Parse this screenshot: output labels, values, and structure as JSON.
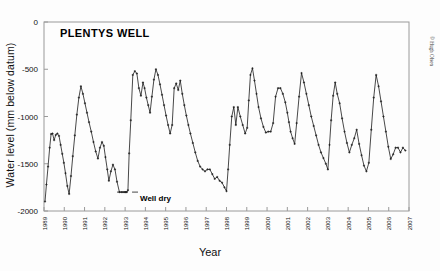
{
  "figure": {
    "title": "PLENTYS WELL",
    "xlabel": "Year",
    "ylabel": "Water level (mm below datum)",
    "credit": "© Hugh Olsen",
    "annotation": "Well dry",
    "line_color": "#1a1a1a",
    "frame_color": "#9a9a9a",
    "background": "#fdfdfd"
  },
  "chart_data": {
    "type": "line",
    "title": "PLENTYS WELL",
    "xlabel": "Year",
    "ylabel": "Water level (mm below datum)",
    "xlim": [
      1989,
      2007
    ],
    "ylim": [
      -2000,
      0
    ],
    "xticks": [
      1989,
      1990,
      1991,
      1992,
      1993,
      1994,
      1995,
      1996,
      1997,
      1998,
      1999,
      2000,
      2001,
      2002,
      2003,
      2004,
      2005,
      2006,
      2007
    ],
    "xtick_labels": [
      "1989",
      "1990",
      "1991",
      "1992",
      "1993",
      "1994",
      "1995",
      "1996",
      "1997",
      "1998",
      "1999",
      "2000",
      "2001",
      "2002",
      "2003",
      "2004",
      "2005",
      "2006",
      "2007"
    ],
    "yticks": [
      0,
      -500,
      -1000,
      -1500,
      -2000
    ],
    "ytick_labels": [
      "0",
      "-500",
      "-1000",
      "-1500",
      "-2000"
    ],
    "grid": false,
    "legend": null,
    "markers": "plus",
    "annotations": [
      {
        "text": "Well dry",
        "x": 1992.75,
        "y": -1800
      }
    ],
    "series": [
      {
        "name": "Water level",
        "color": "#1a1a1a",
        "x": [
          1989.05,
          1989.12,
          1989.2,
          1989.28,
          1989.35,
          1989.42,
          1989.5,
          1989.58,
          1989.66,
          1989.74,
          1989.82,
          1989.9,
          1989.98,
          1990.06,
          1990.15,
          1990.24,
          1990.33,
          1990.42,
          1990.52,
          1990.62,
          1990.72,
          1990.82,
          1990.92,
          1991.02,
          1991.12,
          1991.22,
          1991.33,
          1991.44,
          1991.55,
          1991.66,
          1991.76,
          1991.86,
          1991.95,
          1992.03,
          1992.12,
          1992.2,
          1992.3,
          1992.4,
          1992.5,
          1992.6,
          1992.72,
          1992.84,
          1992.95,
          1993.02,
          1993.08,
          1993.14,
          1993.2,
          1993.28,
          1993.38,
          1993.48,
          1993.58,
          1993.68,
          1993.78,
          1993.88,
          1993.96,
          1994.05,
          1994.14,
          1994.23,
          1994.32,
          1994.42,
          1994.52,
          1994.62,
          1994.72,
          1994.82,
          1994.92,
          1995.02,
          1995.12,
          1995.22,
          1995.32,
          1995.42,
          1995.52,
          1995.62,
          1995.72,
          1995.82,
          1995.92,
          1996.02,
          1996.12,
          1996.22,
          1996.34,
          1996.46,
          1996.58,
          1996.7,
          1996.82,
          1996.94,
          1997.06,
          1997.18,
          1997.3,
          1997.42,
          1997.54,
          1997.66,
          1997.78,
          1997.9,
          1998.0,
          1998.08,
          1998.16,
          1998.26,
          1998.36,
          1998.46,
          1998.56,
          1998.68,
          1998.8,
          1998.92,
          1999.02,
          1999.1,
          1999.18,
          1999.28,
          1999.38,
          1999.48,
          1999.58,
          1999.7,
          1999.82,
          1999.94,
          2000.06,
          2000.18,
          2000.3,
          2000.42,
          2000.54,
          2000.66,
          2000.78,
          2000.9,
          2001.0,
          2001.08,
          2001.16,
          2001.26,
          2001.36,
          2001.46,
          2001.58,
          2001.7,
          2001.82,
          2001.94,
          2002.06,
          2002.18,
          2002.3,
          2002.42,
          2002.54,
          2002.66,
          2002.78,
          2002.9,
          2003.0,
          2003.08,
          2003.16,
          2003.26,
          2003.36,
          2003.46,
          2003.58,
          2003.7,
          2003.82,
          2003.94,
          2004.06,
          2004.18,
          2004.3,
          2004.42,
          2004.54,
          2004.66,
          2004.78,
          2004.9,
          2005.02,
          2005.14,
          2005.26,
          2005.38,
          2005.5,
          2005.62,
          2005.74,
          2005.86,
          2005.98,
          2006.1,
          2006.22,
          2006.34,
          2006.46,
          2006.58,
          2006.7,
          2006.82
        ],
        "y": [
          -1900,
          -1720,
          -1530,
          -1330,
          -1185,
          -1180,
          -1250,
          -1195,
          -1180,
          -1205,
          -1300,
          -1395,
          -1490,
          -1600,
          -1735,
          -1820,
          -1630,
          -1420,
          -1200,
          -980,
          -800,
          -680,
          -760,
          -860,
          -960,
          -1060,
          -1160,
          -1270,
          -1370,
          -1445,
          -1330,
          -1270,
          -1310,
          -1430,
          -1560,
          -1680,
          -1580,
          -1510,
          -1560,
          -1690,
          -1800,
          -1800,
          -1800,
          -1800,
          -1800,
          -1780,
          -1390,
          -1040,
          -560,
          -520,
          -545,
          -700,
          -780,
          -640,
          -700,
          -800,
          -880,
          -960,
          -790,
          -610,
          -500,
          -560,
          -660,
          -770,
          -880,
          -990,
          -1090,
          -1180,
          -1090,
          -700,
          -650,
          -720,
          -620,
          -760,
          -880,
          -990,
          -1090,
          -1180,
          -1280,
          -1380,
          -1470,
          -1530,
          -1560,
          -1580,
          -1560,
          -1560,
          -1610,
          -1660,
          -1640,
          -1680,
          -1700,
          -1750,
          -1790,
          -1560,
          -1300,
          -1000,
          -900,
          -1090,
          -900,
          -1000,
          -1090,
          -1180,
          -1120,
          -830,
          -560,
          -490,
          -620,
          -760,
          -900,
          -1020,
          -1110,
          -1170,
          -1160,
          -1160,
          -1070,
          -790,
          -700,
          -700,
          -760,
          -850,
          -960,
          -1060,
          -1160,
          -1230,
          -1290,
          -1070,
          -790,
          -540,
          -640,
          -760,
          -880,
          -1000,
          -1100,
          -1200,
          -1300,
          -1380,
          -1440,
          -1500,
          -1560,
          -1300,
          -1040,
          -780,
          -640,
          -760,
          -860,
          -1020,
          -1160,
          -1280,
          -1380,
          -1300,
          -1230,
          -1140,
          -1290,
          -1410,
          -1520,
          -1580,
          -1490,
          -1140,
          -800,
          -560,
          -680,
          -840,
          -1000,
          -1160,
          -1320,
          -1450,
          -1400,
          -1330,
          -1330,
          -1380,
          -1330,
          -1360
        ]
      },
      {
        "name": "Well dry flat segment",
        "color": "#1a1a1a",
        "x": [
          1992.6,
          1993.12
        ],
        "y": [
          -1800,
          -1800
        ]
      }
    ]
  }
}
